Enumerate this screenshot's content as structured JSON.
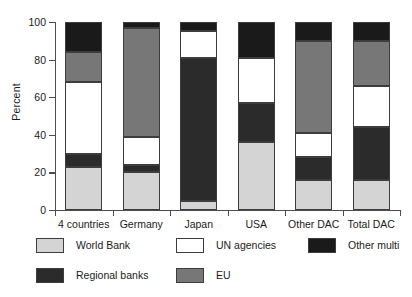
{
  "chart_data": {
    "type": "bar",
    "subtype": "stacked-bar-100-percent",
    "title": "",
    "subtitle": "",
    "xlabel": "",
    "ylabel": "Percent",
    "ylim": [
      0,
      100
    ],
    "yticks": [
      0,
      20,
      40,
      60,
      80,
      100
    ],
    "ytick_labels": [
      "0",
      "20",
      "40",
      "60",
      "80",
      "100"
    ],
    "grid": false,
    "legend_position": "bottom",
    "categories": [
      "4 countries",
      "Germany",
      "Japan",
      "USA",
      "Other DAC",
      "Total DAC"
    ],
    "series": [
      {
        "name": "World Bank",
        "color": "#d4d4d4",
        "values": [
          23,
          20,
          5,
          36,
          16,
          16
        ]
      },
      {
        "name": "Regional banks",
        "color": "#2b2b2b",
        "values": [
          7,
          4,
          76,
          21,
          12,
          28
        ]
      },
      {
        "name": "UN agencies",
        "color": "#ffffff",
        "values": [
          38,
          15,
          14,
          24,
          13,
          22
        ]
      },
      {
        "name": "EU",
        "color": "#777777",
        "values": [
          16,
          58,
          0,
          0,
          49,
          24
        ]
      },
      {
        "name": "Other multi",
        "color": "#1a1a1a",
        "values": [
          16,
          3,
          5,
          19,
          10,
          10
        ]
      }
    ],
    "stack_order_bottom_to_top": [
      "World Bank",
      "Regional banks",
      "UN agencies",
      "EU",
      "Other multi"
    ],
    "segment_boundaries_percent": {
      "4 countries": [
        0,
        23,
        30,
        68,
        84,
        100
      ],
      "Germany": [
        0,
        20,
        24,
        39,
        97,
        100
      ],
      "Japan": [
        0,
        5,
        81,
        95,
        95,
        100
      ],
      "USA": [
        0,
        36,
        57,
        81,
        81,
        100
      ],
      "Other DAC": [
        0,
        16,
        28,
        41,
        90,
        100
      ],
      "Total DAC": [
        0,
        16,
        44,
        66,
        90,
        100
      ]
    }
  },
  "legend": {
    "entries": [
      {
        "label": "World Bank",
        "color": "#d4d4d4"
      },
      {
        "label": "UN agencies",
        "color": "#ffffff"
      },
      {
        "label": "Other multi",
        "color": "#1a1a1a"
      },
      {
        "label": "Regional banks",
        "color": "#2b2b2b"
      },
      {
        "label": "EU",
        "color": "#777777"
      }
    ]
  },
  "axis": {
    "y_title": "Percent",
    "y_tick_labels": [
      "100",
      "80",
      "60",
      "40",
      "20",
      "0"
    ],
    "x_tick_labels": [
      "4 countries",
      "Germany",
      "Japan",
      "USA",
      "Other DAC",
      "Total DAC"
    ]
  },
  "colors": {
    "axis": "#4d4d4d",
    "outline": "#3d3d3d",
    "background": "#ffffff",
    "text": "#1a1a1a"
  }
}
